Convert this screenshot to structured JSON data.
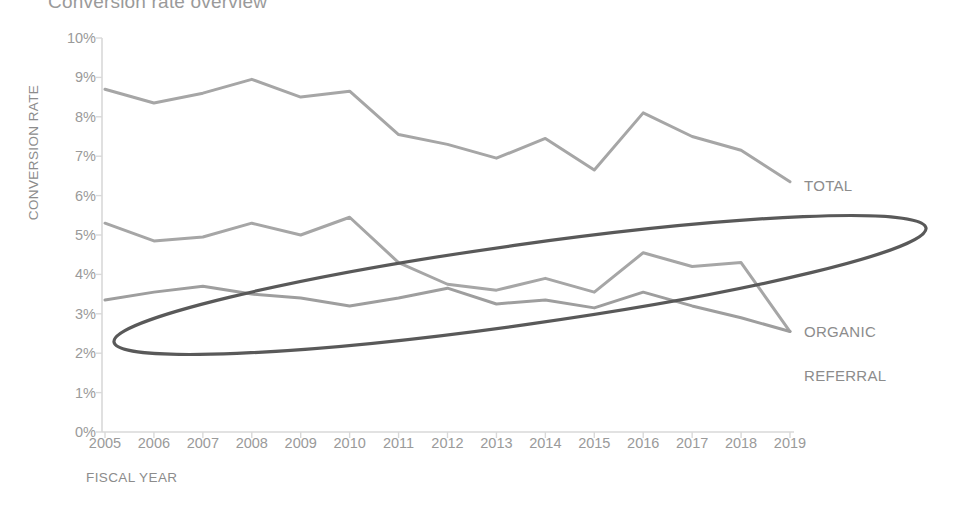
{
  "chart_data": {
    "type": "line",
    "title": "Conversion rate overview",
    "xlabel": "FISCAL YEAR",
    "ylabel": "CONVERSION RATE",
    "x": [
      2005,
      2006,
      2007,
      2008,
      2009,
      2010,
      2011,
      2012,
      2013,
      2014,
      2015,
      2016,
      2017,
      2018,
      2019
    ],
    "categories": [
      "2005",
      "2006",
      "2007",
      "2008",
      "2009",
      "2010",
      "2011",
      "2012",
      "2013",
      "2014",
      "2015",
      "2016",
      "2017",
      "2018",
      "2019"
    ],
    "ylim": [
      0,
      10
    ],
    "yticks": [
      0,
      1,
      2,
      3,
      4,
      5,
      6,
      7,
      8,
      9,
      10
    ],
    "ytick_labels": [
      "0%",
      "1%",
      "2%",
      "3%",
      "4%",
      "5%",
      "6%",
      "7%",
      "8%",
      "9%",
      "10%"
    ],
    "grid": false,
    "legend_position": "right-inline-labels",
    "series": [
      {
        "name": "TOTAL",
        "color": "#a6a6a6",
        "values": [
          8.7,
          8.35,
          8.6,
          8.95,
          8.5,
          8.65,
          7.55,
          7.3,
          6.95,
          7.45,
          6.65,
          8.1,
          7.5,
          7.15,
          6.35
        ]
      },
      {
        "name": "ORGANIC",
        "color": "#a6a6a6",
        "values": [
          5.3,
          4.85,
          4.95,
          5.3,
          5.0,
          5.45,
          4.3,
          3.75,
          3.6,
          3.9,
          3.55,
          4.55,
          4.2,
          4.3,
          2.55
        ]
      },
      {
        "name": "REFERRAL",
        "color": "#9e9e9e",
        "values": [
          3.35,
          3.55,
          3.7,
          3.5,
          3.4,
          3.2,
          3.4,
          3.65,
          3.25,
          3.35,
          3.15,
          3.55,
          3.2,
          2.9,
          2.55
        ]
      }
    ],
    "annotations": [
      {
        "type": "ellipse",
        "name": "highlight-ellipse",
        "color": "#595959",
        "note": "Hand-drawn oval encircling the ORGANIC and REFERRAL series"
      }
    ]
  },
  "axis": {
    "axis_line_color": "#d9d9d9",
    "tick_color": "#d9d9d9"
  }
}
